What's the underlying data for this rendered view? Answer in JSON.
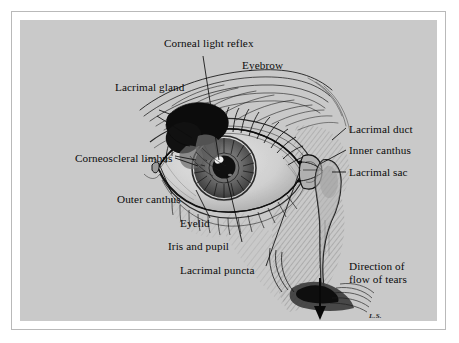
{
  "figure": {
    "domain": "anatomical-illustration",
    "background_color": "#c9c9c9",
    "frame_color": "#b9b9b9",
    "ink_color": "#111111",
    "signature": "L.S."
  },
  "labels": [
    {
      "id": "corneal-light-reflex",
      "text": "Corneal light reflex",
      "x": 144,
      "y": 24,
      "align": "left"
    },
    {
      "id": "eyebrow",
      "text": "Eyebrow",
      "x": 222,
      "y": 46,
      "align": "left"
    },
    {
      "id": "lacrimal-gland",
      "text": "Lacrimal gland",
      "x": 103,
      "y": 68,
      "align": "left"
    },
    {
      "id": "corneoscleral-limbus",
      "text": "Corneoscleral limbus",
      "x": 64,
      "y": 139,
      "align": "left"
    },
    {
      "id": "lacrimal-duct",
      "text": "Lacrimal duct",
      "x": 329,
      "y": 110,
      "align": "left"
    },
    {
      "id": "inner-canthus",
      "text": "Inner canthus",
      "x": 329,
      "y": 131,
      "align": "left"
    },
    {
      "id": "lacrimal-sac",
      "text": "Lacrimal sac",
      "x": 329,
      "y": 154,
      "align": "left"
    },
    {
      "id": "outer-canthus",
      "text": "Outer canthus",
      "x": 105,
      "y": 180,
      "align": "left"
    },
    {
      "id": "eyelid",
      "text": "Eyelid",
      "x": 168,
      "y": 204,
      "align": "left"
    },
    {
      "id": "iris-and-pupil",
      "text": "Iris and pupil",
      "x": 156,
      "y": 227,
      "align": "left"
    },
    {
      "id": "lacrimal-puncta",
      "text": "Lacrimal puncta",
      "x": 168,
      "y": 251,
      "align": "left"
    }
  ],
  "flow_note": {
    "id": "direction-of-flow-of-tears",
    "line1": "Direction of",
    "line2": "flow of tears",
    "x": 329,
    "y": 247
  },
  "structures": [
    "eyebrow",
    "upper eyelid with lashes",
    "lower eyelid with lashes",
    "iris and pupil",
    "corneal light reflex",
    "corneoscleral limbus",
    "lacrimal gland",
    "lacrimal puncta",
    "lacrimal sac",
    "nasolacrimal duct",
    "inner canthus",
    "outer canthus",
    "nostril",
    "tear flow arrow"
  ]
}
